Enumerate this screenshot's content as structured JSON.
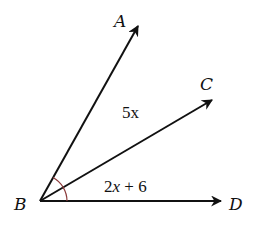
{
  "diagram": {
    "type": "angle-rays",
    "vertex": {
      "label": "B",
      "x": 40,
      "y": 201
    },
    "rays": [
      {
        "label": "A",
        "tip": {
          "x": 138,
          "y": 25
        }
      },
      {
        "label": "C",
        "tip": {
          "x": 213,
          "y": 99
        }
      },
      {
        "label": "D",
        "tip": {
          "x": 222,
          "y": 202
        }
      }
    ],
    "angles": [
      {
        "between": "ABC",
        "expression": "5x"
      },
      {
        "between": "CBD",
        "expression": "2x + 6"
      }
    ],
    "labels": {
      "A": "A",
      "B": "B",
      "C": "C",
      "D": "D",
      "angle_abc": "5x",
      "angle_cbd_coef": "2",
      "angle_cbd_var": "x",
      "angle_cbd_rest": " + 6"
    },
    "colors": {
      "line": "#111111",
      "arc": "#8b3a3a"
    }
  }
}
